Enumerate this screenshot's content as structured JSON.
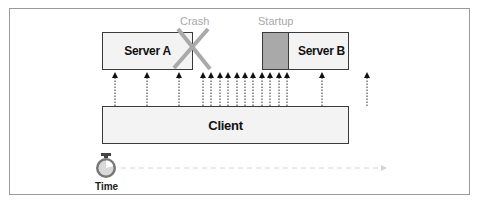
{
  "diagram": {
    "nodes": {
      "server_a": {
        "label": "Server A"
      },
      "server_b": {
        "label": "Server B"
      },
      "client": {
        "label": "Client"
      }
    },
    "annotations": {
      "crash": "Crash",
      "startup": "Startup"
    },
    "timeline": {
      "label": "Time",
      "icon": "stopwatch-icon"
    },
    "request_arrows_x": [
      115,
      147,
      179,
      203,
      211,
      220,
      228,
      237,
      245,
      253,
      262,
      270,
      279,
      287,
      322,
      367
    ],
    "colors": {
      "box_fill": "#f3f3f3",
      "box_border": "#3a3a3a",
      "crash_x": "#a9a9a9",
      "startup_fill": "#a9a9a9",
      "annotation_text": "#a8a8a8",
      "timeline": "#d0d0d0"
    }
  }
}
